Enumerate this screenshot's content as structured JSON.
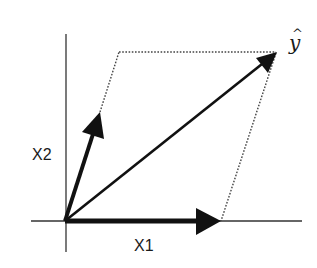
{
  "diagram": {
    "type": "vector-parallelogram",
    "labels": {
      "x1": "X1",
      "x2": "X2",
      "yhat_base": "y",
      "yhat_hat": "^"
    },
    "colors": {
      "background": "#ffffff",
      "vectors": "#111111",
      "axes": "#333333",
      "dotted": "#444444",
      "text": "#1a1a1a"
    },
    "vectors": [
      {
        "name": "X1",
        "from": [
          65,
          221
        ],
        "to": [
          220,
          221
        ]
      },
      {
        "name": "X2",
        "from": [
          65,
          221
        ],
        "to": [
          100,
          112
        ]
      },
      {
        "name": "y-hat",
        "from": [
          65,
          221
        ],
        "to": [
          276,
          53
        ]
      }
    ],
    "parallelogram_dotted_edges": [
      {
        "from": [
          100,
          112
        ],
        "to": [
          119,
          52
        ]
      },
      {
        "from": [
          119,
          52
        ],
        "to": [
          276,
          52
        ]
      },
      {
        "from": [
          276,
          53
        ],
        "to": [
          221,
          221
        ]
      }
    ]
  }
}
